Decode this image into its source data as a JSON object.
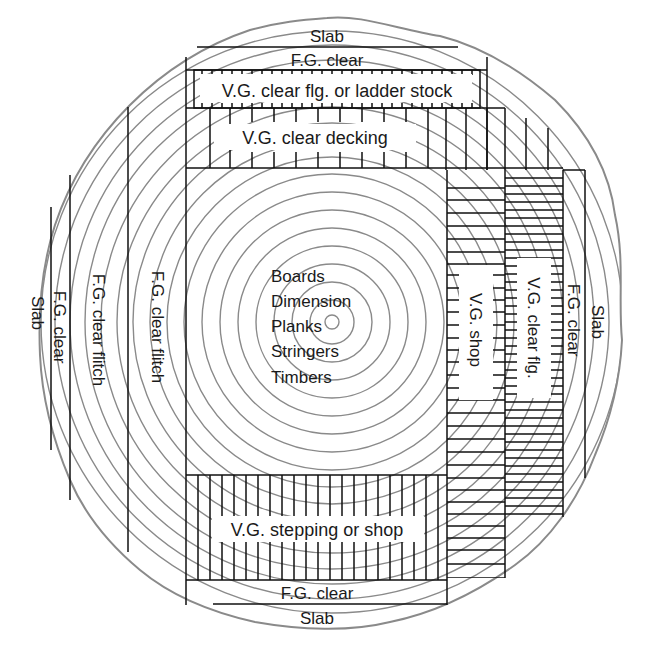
{
  "diagram": {
    "colors": {
      "rings": "#8a8a8a",
      "lines": "#111111",
      "text": "#1a1a1a",
      "background": "#ffffff"
    },
    "labels": {
      "slab_top": "Slab",
      "fg_clear_top": "F.G. clear",
      "vg_flg_ladder": "V.G. clear flg. or ladder stock",
      "vg_decking": "V.G. clear decking",
      "center_products": [
        "Boards",
        "Dimension",
        "Planks",
        "Stringers",
        "Timbers"
      ],
      "vg_shop": "V.G. shop",
      "vg_clear_flg": "V.G. clear flg.",
      "fg_clear_right": "F.G. clear",
      "slab_right": "Slab",
      "fg_clear_flitch_inner": "F.G. clear flitch",
      "fg_clear_flitch_outer": "F.G. clear flitch",
      "fg_clear_left": "F.G. clear",
      "slab_left": "Slab",
      "vg_stepping_shop": "V.G. stepping or shop",
      "fg_clear_bottom": "F.G. clear",
      "slab_bottom": "Slab"
    }
  }
}
